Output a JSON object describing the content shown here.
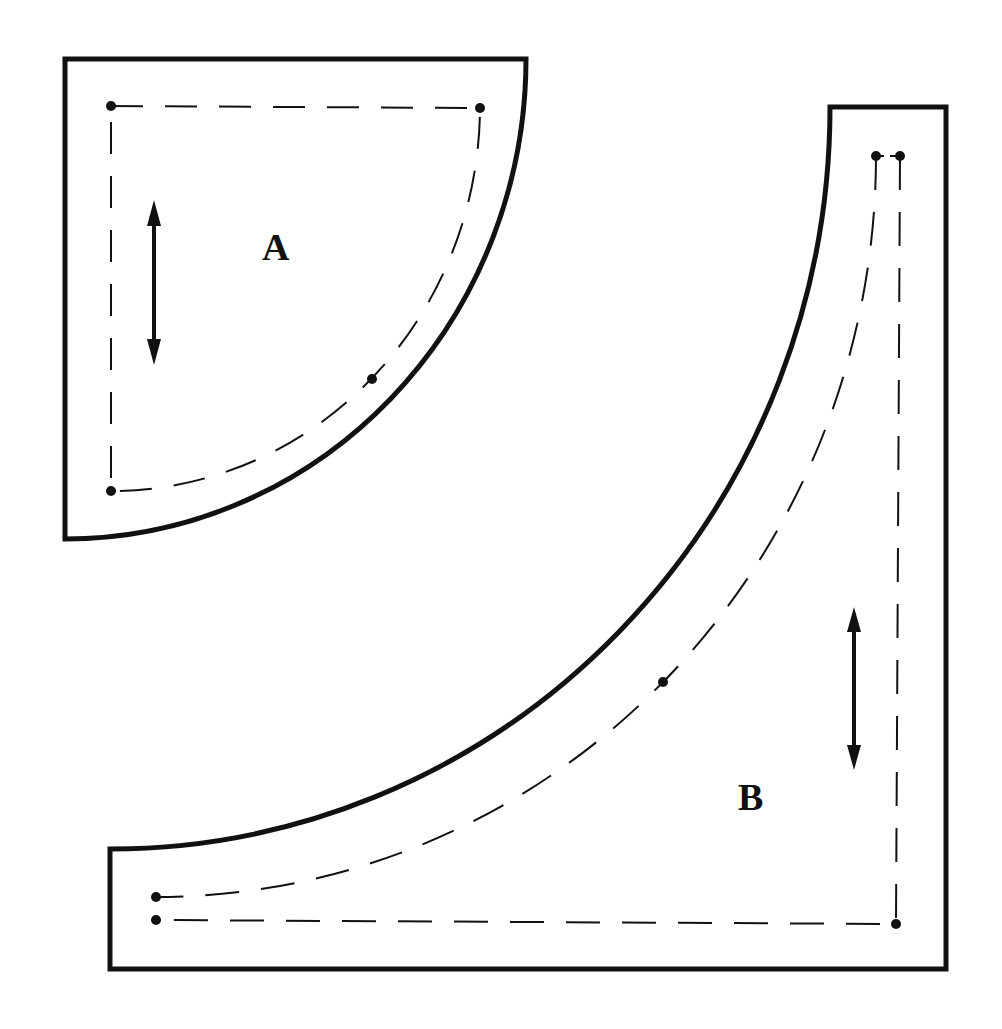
{
  "diagram": {
    "type": "sewing-pattern-template",
    "colors": {
      "line": "#111111",
      "background": "#ffffff"
    },
    "pieces": [
      {
        "id": "A",
        "label": "A",
        "shape": "quarter-circle",
        "grainline": "vertical double-headed arrow",
        "seam_points": 4
      },
      {
        "id": "B",
        "label": "B",
        "shape": "square with concave quarter-circle cutout",
        "grainline": "vertical double-headed arrow",
        "seam_points": 6
      }
    ]
  }
}
